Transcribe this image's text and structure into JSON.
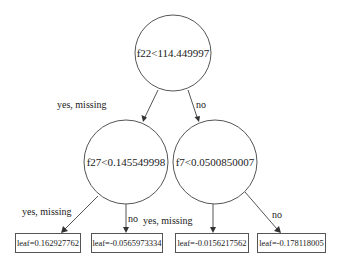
{
  "diagram": {
    "type": "decision-tree",
    "root": {
      "id": "n0",
      "label": "f22<114.449997"
    },
    "internal_nodes": [
      {
        "id": "n1",
        "label": "f27<0.145549998"
      },
      {
        "id": "n2",
        "label": "f7<0.0500850007"
      }
    ],
    "leaves": [
      {
        "id": "l1",
        "label": "leaf=0.162927762"
      },
      {
        "id": "l2",
        "label": "leaf=-0.0565973334"
      },
      {
        "id": "l3",
        "label": "leaf=-0.0156217562"
      },
      {
        "id": "l4",
        "label": "leaf=-0.178118005"
      }
    ],
    "edges": [
      {
        "from": "n0",
        "to": "n1",
        "label": "yes, missing"
      },
      {
        "from": "n0",
        "to": "n2",
        "label": "no"
      },
      {
        "from": "n1",
        "to": "l1",
        "label": "yes, missing"
      },
      {
        "from": "n1",
        "to": "l2",
        "label": "no"
      },
      {
        "from": "n2",
        "to": "l3",
        "label": "yes, missing"
      },
      {
        "from": "n2",
        "to": "l4",
        "label": "no"
      }
    ]
  },
  "colors": {
    "stroke": "#555555",
    "text": "#1a1a1a",
    "background": "#ffffff"
  }
}
